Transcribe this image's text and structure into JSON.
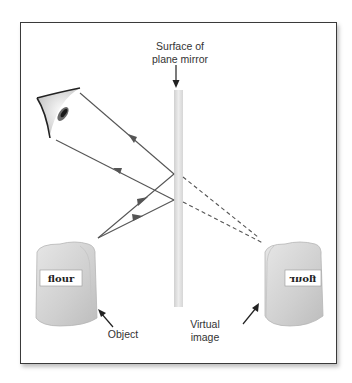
{
  "diagram": {
    "labels": {
      "mirror_line1": "Surface of",
      "mirror_line2": "plane mirror",
      "object": "Object",
      "virtual_line1": "Virtual",
      "virtual_line2": "image"
    },
    "object_bag_text": "flour",
    "virtual_bag_text": "flour",
    "elements": [
      "eye",
      "plane mirror",
      "object (flour bag)",
      "virtual image (mirrored flour bag)",
      "incident rays",
      "reflected rays",
      "dashed extension rays"
    ],
    "colors": {
      "ray": "#555555",
      "mirror": "#dcdcdc",
      "frame": "#3a3a3a",
      "bag": "#d8d8d8"
    }
  }
}
